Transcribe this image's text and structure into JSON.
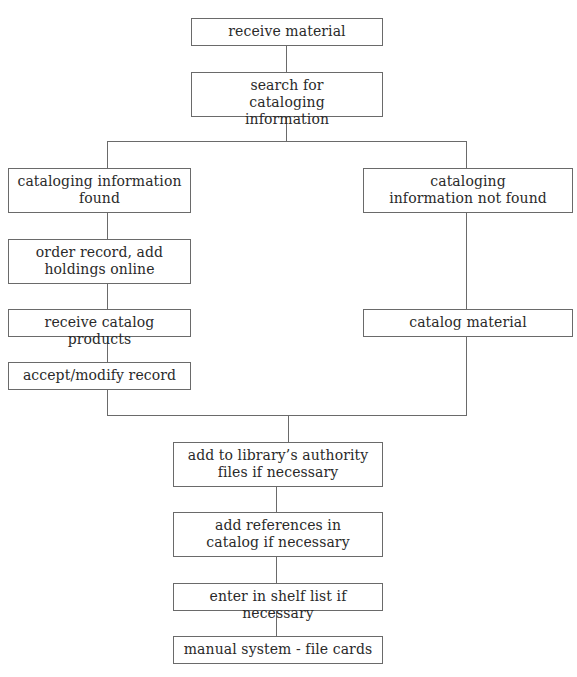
{
  "diagram": {
    "type": "flowchart",
    "title": "",
    "nodes": [
      {
        "id": "receive_material",
        "label": "receive material"
      },
      {
        "id": "search_info",
        "label": "search for cataloging information"
      },
      {
        "id": "info_found",
        "label": "cataloging information found"
      },
      {
        "id": "info_not_found",
        "label": "cataloging information not found"
      },
      {
        "id": "order_record",
        "label": "order record, add holdings online"
      },
      {
        "id": "receive_products",
        "label": "receive catalog products"
      },
      {
        "id": "accept_modify",
        "label": "accept/modify record"
      },
      {
        "id": "catalog_material",
        "label": "catalog material"
      },
      {
        "id": "authority_files",
        "label": "add to library’s authority files if necessary"
      },
      {
        "id": "add_references",
        "label": "add references in catalog if necessary"
      },
      {
        "id": "shelf_list",
        "label": "enter in shelf list if necessary"
      },
      {
        "id": "manual_system",
        "label": "manual system - file cards"
      }
    ],
    "edges": [
      [
        "receive_material",
        "search_info"
      ],
      [
        "search_info",
        "info_found"
      ],
      [
        "search_info",
        "info_not_found"
      ],
      [
        "info_found",
        "order_record"
      ],
      [
        "order_record",
        "receive_products"
      ],
      [
        "receive_products",
        "accept_modify"
      ],
      [
        "info_not_found",
        "catalog_material"
      ],
      [
        "accept_modify",
        "authority_files"
      ],
      [
        "catalog_material",
        "authority_files"
      ],
      [
        "authority_files",
        "add_references"
      ],
      [
        "add_references",
        "shelf_list"
      ],
      [
        "shelf_list",
        "manual_system"
      ]
    ]
  },
  "colors": {
    "line": "#6a6a6a",
    "text": "#2a2a2a",
    "background": "#ffffff"
  }
}
